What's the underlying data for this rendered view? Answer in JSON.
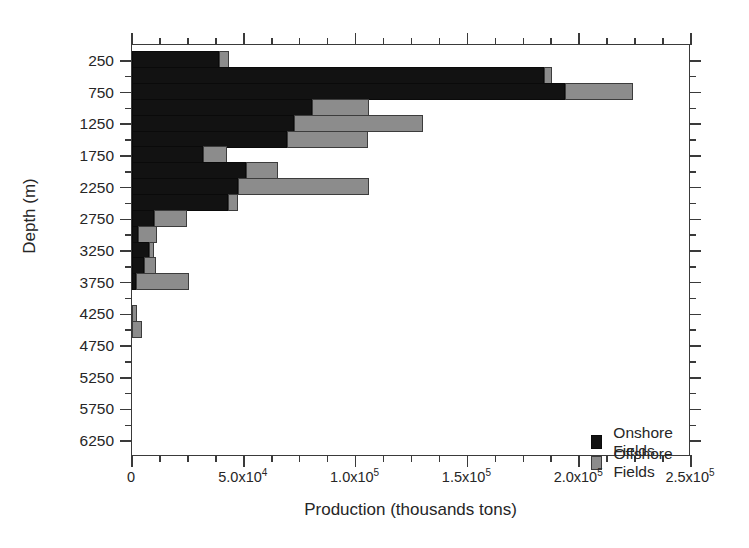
{
  "chart_data": {
    "type": "bar",
    "orientation": "horizontal",
    "title": "",
    "panel_label": "b",
    "xlabel": "Production (thousands tons)",
    "ylabel": "Depth (m)",
    "xlim": [
      0,
      250000
    ],
    "ylim_depth": [
      0,
      6500
    ],
    "grid": false,
    "legend_position": "inside lower right",
    "x_ticks": [
      {
        "value": 0,
        "label": "0",
        "mantissa": "0",
        "exponent": ""
      },
      {
        "value": 50000,
        "label": "5.0x10^4",
        "mantissa": "5.0x10",
        "exponent": "4"
      },
      {
        "value": 100000,
        "label": "1.0x10^5",
        "mantissa": "1.0x10",
        "exponent": "5"
      },
      {
        "value": 150000,
        "label": "1.5x10^5",
        "mantissa": "1.5x10",
        "exponent": "5"
      },
      {
        "value": 200000,
        "label": "2.0x10^5",
        "mantissa": "2.0x10",
        "exponent": "5"
      },
      {
        "value": 250000,
        "label": "2.5x10^5",
        "mantissa": "2.5x10",
        "exponent": "5"
      }
    ],
    "x_minor_tick_interval": 12500,
    "y_ticks": [
      250,
      750,
      1250,
      1750,
      2250,
      2750,
      3250,
      3750,
      4250,
      4750,
      5250,
      5750,
      6250
    ],
    "y_minor_ticks": [
      500,
      1000,
      1500,
      2000,
      2500,
      3000,
      3500,
      4000,
      4500,
      5000,
      5500,
      6000,
      6500
    ],
    "categories": [
      250,
      500,
      750,
      1000,
      1250,
      1500,
      1750,
      2000,
      2250,
      2500,
      2750,
      3000,
      3250,
      3500,
      3750,
      4000,
      4250,
      4500,
      4750,
      5000,
      5250,
      5500,
      5750,
      6000,
      6250
    ],
    "series": [
      {
        "name": "Onshore Fields",
        "color": "#121212",
        "values": [
          38900,
          184300,
          193600,
          80500,
          72400,
          69300,
          31700,
          50900,
          47400,
          42900,
          9800,
          2700,
          7600,
          5400,
          1800,
          0,
          0,
          0,
          0,
          0,
          0,
          0,
          0,
          0,
          0
        ]
      },
      {
        "name": "Offshore Fields",
        "color": "#8c8c8c",
        "values": [
          4500,
          3600,
          30400,
          25500,
          57700,
          36200,
          10700,
          14300,
          58600,
          4500,
          14800,
          8500,
          2200,
          5400,
          23700,
          0,
          2200,
          4500,
          0,
          0,
          0,
          0,
          0,
          0,
          0
        ]
      }
    ],
    "totals": [
      43400,
      187900,
      224000,
      106000,
      130100,
      105500,
      42400,
      65200,
      106000,
      47400,
      24600,
      11200,
      9800,
      10800,
      25500,
      0,
      2200,
      4500,
      0,
      0,
      0,
      0,
      0,
      0,
      0
    ]
  },
  "legend": {
    "entries": [
      {
        "label": "Onshore Fields",
        "swatch": "onshore"
      },
      {
        "label": "Offshore Fields",
        "swatch": "offshore"
      }
    ]
  }
}
